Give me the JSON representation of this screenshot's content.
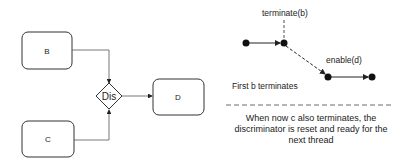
{
  "diagram": {
    "nodes": {
      "b": {
        "label": "B"
      },
      "c": {
        "label": "C"
      },
      "d": {
        "label": "D"
      },
      "dis": {
        "label": "Dis"
      }
    },
    "timeline": {
      "terminate_label": "terminate(b)",
      "enable_label": "enable(d)",
      "caption": "First b terminates"
    },
    "note": "When now c also terminates, the discriminator is reset and ready for the next thread"
  },
  "colors": {
    "stroke": "#333333",
    "text": "#222222"
  }
}
